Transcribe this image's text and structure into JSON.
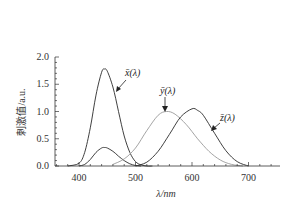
{
  "chart_data": {
    "type": "line",
    "title": "",
    "xlabel": "λ/nm",
    "ylabel": "刺激值/a.u.",
    "xlim": [
      357,
      755
    ],
    "ylim": [
      0,
      2.0
    ],
    "grid": false,
    "legend": "inline annotations with arrows",
    "x_ticks": [
      400,
      500,
      600,
      700
    ],
    "y_ticks": [
      "0.0",
      "0.5",
      "1.0",
      "1.5",
      "2.0"
    ],
    "series": [
      {
        "name": "x̄(λ)",
        "color": "#2a2a2a",
        "description": "tall primary peak",
        "x": [
          380,
          400,
          410,
          420,
          430,
          440,
          445,
          450,
          460,
          470,
          480,
          490,
          500,
          510,
          520,
          530
        ],
        "values": [
          0.0,
          0.05,
          0.25,
          0.7,
          1.3,
          1.72,
          1.78,
          1.74,
          1.45,
          1.0,
          0.55,
          0.25,
          0.08,
          0.02,
          0.0,
          0.0
        ]
      },
      {
        "name": "x̄(λ) secondary lobe",
        "color": "#2a2a2a",
        "description": "small short-wavelength bump",
        "x": [
          400,
          410,
          420,
          430,
          440,
          445,
          450,
          460,
          470,
          480,
          490,
          500,
          510
        ],
        "values": [
          0.0,
          0.03,
          0.12,
          0.25,
          0.33,
          0.34,
          0.33,
          0.27,
          0.18,
          0.1,
          0.04,
          0.01,
          0.0
        ]
      },
      {
        "name": "ȳ(λ)",
        "color": "#9a9a9a",
        "x": [
          460,
          480,
          500,
          520,
          540,
          555,
          570,
          590,
          610,
          630,
          650,
          670,
          690
        ],
        "values": [
          0.03,
          0.13,
          0.33,
          0.65,
          0.93,
          1.0,
          0.95,
          0.76,
          0.5,
          0.27,
          0.11,
          0.03,
          0.0
        ]
      },
      {
        "name": "z̄(λ)",
        "color": "#2a2a2a",
        "x": [
          500,
          520,
          540,
          560,
          580,
          600,
          610,
          620,
          640,
          660,
          680,
          700
        ],
        "values": [
          0.0,
          0.07,
          0.27,
          0.58,
          0.9,
          1.05,
          1.02,
          0.93,
          0.6,
          0.28,
          0.08,
          0.0
        ]
      }
    ],
    "annotations": [
      {
        "text": "x̄(λ)",
        "points_to": "tall peak, descending side ~465 nm"
      },
      {
        "text": "ȳ(λ)",
        "points_to": "ȳ peak ~555 nm"
      },
      {
        "text": "z̄(λ)",
        "points_to": "z̄ descending side ~640 nm"
      }
    ]
  },
  "labels": {
    "xlabel": "λ/nm",
    "ylabel": "刺激值/a.u.",
    "x_ticks": [
      "400",
      "500",
      "600",
      "700"
    ],
    "y_ticks": [
      "0.0",
      "0.5",
      "1.0",
      "1.5",
      "2.0"
    ],
    "ann_x": "x̄(λ)",
    "ann_y": "ȳ(λ)",
    "ann_z": "z̄(λ)"
  }
}
